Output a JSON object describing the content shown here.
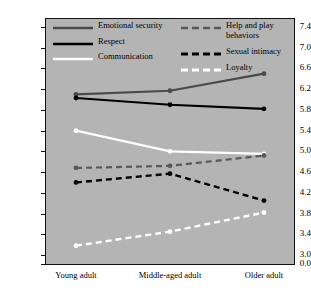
{
  "chart_data": {
    "type": "line",
    "title": "",
    "xlabel": "",
    "ylabel": "",
    "categories": [
      "Young adult",
      "Middle-aged adult",
      "Older adult"
    ],
    "ylim": [
      3.0,
      7.4
    ],
    "yticks": [
      "7.4",
      "7.0",
      "6.6",
      "6.2",
      "5.8",
      "5.4",
      "5.0",
      "4.6",
      "4.2",
      "3.8",
      "3.4",
      "3.0",
      "0.0"
    ],
    "ytick_values": [
      7.4,
      7.0,
      6.6,
      6.2,
      5.8,
      5.4,
      5.0,
      4.6,
      4.2,
      3.8,
      3.4,
      3.0,
      0.0
    ],
    "axis_break": true,
    "grid": false,
    "legend_position": "top-inside",
    "plot_background": "#b4b4b4",
    "series": [
      {
        "name": "Emotional security",
        "values": [
          6.1,
          6.17,
          6.5
        ],
        "color": "#4a4a4a",
        "style": "solid",
        "width": 2.2,
        "marker": true
      },
      {
        "name": "Respect",
        "values": [
          6.03,
          5.9,
          5.82
        ],
        "color": "#000000",
        "style": "solid",
        "width": 2.2,
        "marker": true
      },
      {
        "name": "Communication",
        "values": [
          5.4,
          5.0,
          4.95
        ],
        "color": "#ffffff",
        "style": "solid",
        "width": 2.2,
        "marker": true
      },
      {
        "name": "Help and play behaviors",
        "values": [
          4.68,
          4.72,
          4.92
        ],
        "color": "#595959",
        "style": "dashed",
        "width": 2.2,
        "marker": true
      },
      {
        "name": "Sexual intimacy",
        "values": [
          4.4,
          4.57,
          4.05
        ],
        "color": "#000000",
        "style": "dashed",
        "width": 2.4,
        "marker": true
      },
      {
        "name": "Loyalty",
        "values": [
          3.18,
          3.45,
          3.82
        ],
        "color": "#ffffff",
        "style": "dashed",
        "width": 2.4,
        "marker": true
      }
    ]
  },
  "legend": {
    "entries": [
      {
        "label": "Emotional security"
      },
      {
        "label": "Respect"
      },
      {
        "label": "Communication"
      },
      {
        "label": "Help and play behaviors"
      },
      {
        "label": "Sexual intimacy"
      },
      {
        "label": "Loyalty"
      }
    ]
  }
}
